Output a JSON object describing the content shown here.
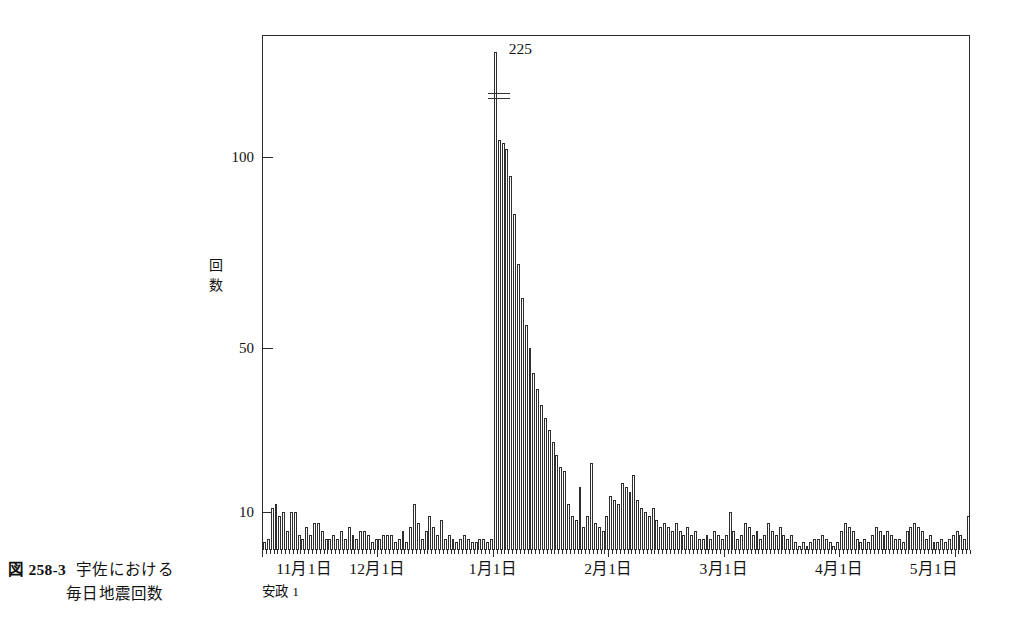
{
  "figure": {
    "number": "図 258-3",
    "title": "宇佐における",
    "subtitle": "毎日地震回数"
  },
  "chart_data": {
    "type": "bar",
    "xlabel": "",
    "ylabel": "回 数",
    "era_note": "安政 1",
    "ylim": [
      0,
      130
    ],
    "yticks": [
      10,
      50,
      100
    ],
    "ytick_labels": [
      "10",
      "50",
      "100"
    ],
    "grid": false,
    "legend": null,
    "annotations": [
      {
        "text": "225",
        "note": "peak value with axis break marker",
        "x_index": 61
      }
    ],
    "xtick_labels": [
      "11月1日",
      "12月1日",
      "1月1日",
      "2月1日",
      "3月1日",
      "4月1日",
      "5月1日"
    ],
    "xtick_indices": [
      0,
      30,
      60,
      90,
      120,
      150,
      180
    ],
    "categories_note": "daily, 11月1日 (安政1) through 5月1日",
    "values": [
      2,
      3,
      11,
      12,
      9,
      10,
      5,
      10,
      10,
      4,
      3,
      6,
      4,
      7,
      7,
      5,
      3,
      3,
      4,
      3,
      5,
      3,
      6,
      4,
      3,
      5,
      5,
      4,
      2,
      3,
      3,
      4,
      4,
      4,
      2,
      3,
      5,
      2,
      6,
      12,
      7,
      3,
      5,
      9,
      6,
      4,
      8,
      3,
      4,
      3,
      2,
      3,
      4,
      3,
      2,
      2,
      3,
      3,
      2,
      3,
      225,
      120,
      117,
      110,
      95,
      85,
      72,
      63,
      56,
      50,
      44,
      40,
      36,
      33,
      30,
      27,
      24,
      21,
      20,
      12,
      9,
      8,
      16,
      6,
      9,
      22,
      7,
      6,
      5,
      9,
      14,
      13,
      12,
      17,
      16,
      15,
      19,
      13,
      11,
      10,
      9,
      11,
      8,
      6,
      7,
      6,
      5,
      7,
      5,
      4,
      6,
      4,
      5,
      3,
      3,
      4,
      3,
      5,
      4,
      3,
      4,
      10,
      5,
      3,
      4,
      7,
      6,
      4,
      5,
      3,
      4,
      7,
      5,
      4,
      6,
      4,
      3,
      4,
      2,
      1,
      2,
      1,
      2,
      3,
      3,
      4,
      3,
      2,
      1,
      2,
      5,
      7,
      6,
      5,
      3,
      2,
      3,
      2,
      4,
      6,
      5,
      4,
      5,
      4,
      3,
      3,
      2,
      5,
      6,
      7,
      6,
      5,
      3,
      4,
      2,
      2,
      3,
      2,
      3,
      4,
      5,
      4,
      3,
      9
    ]
  }
}
